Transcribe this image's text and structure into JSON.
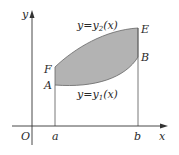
{
  "figure": {
    "axes": {
      "x_label": "x",
      "y_label": "y",
      "origin_label": "O"
    },
    "ticks": {
      "a": "a",
      "b": "b"
    },
    "points": {
      "A": "A",
      "B": "B",
      "E": "E",
      "F": "F"
    },
    "curves": {
      "upper": {
        "prefix": "y=y",
        "sub": "2",
        "suffix": "(x)"
      },
      "lower": {
        "prefix": "y=y",
        "sub": "1",
        "suffix": "(x)"
      }
    },
    "colors": {
      "fill": "#b3b3b3",
      "stroke": "#555555",
      "axis": "#333333"
    }
  }
}
